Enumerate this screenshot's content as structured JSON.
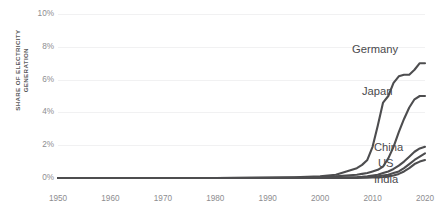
{
  "chart_data": {
    "type": "line",
    "title": "",
    "subtitle": "",
    "xlabel": "",
    "ylabel": "SHARE OF ELECTRICITY\nGENERATION",
    "xlim": [
      1950,
      2020
    ],
    "ylim": [
      0,
      10
    ],
    "grid": true,
    "legend_position": "right-inline-labels",
    "x_ticks": [
      "1950",
      "1960",
      "1970",
      "1980",
      "1990",
      "2000",
      "2010",
      "2020"
    ],
    "x_tick_values": [
      1950,
      1960,
      1970,
      1980,
      1990,
      2000,
      2010,
      2020
    ],
    "y_ticks": [
      "0%",
      "2%",
      "4%",
      "6%",
      "8%",
      "10%"
    ],
    "y_tick_values": [
      0,
      2,
      4,
      6,
      8,
      10
    ],
    "line_color": "#4d4d4f",
    "x": [
      1950,
      1960,
      1970,
      1980,
      1990,
      1995,
      2000,
      2003,
      2005,
      2007,
      2008,
      2009,
      2010,
      2011,
      2012,
      2013,
      2014,
      2015,
      2016,
      2017,
      2018,
      2019,
      2020
    ],
    "series": [
      {
        "name": "Germany",
        "label": "Germany",
        "color": "#4d4d4f",
        "values": [
          0,
          0,
          0,
          0,
          0.02,
          0.05,
          0.1,
          0.2,
          0.4,
          0.6,
          0.8,
          1.1,
          1.9,
          3.2,
          4.6,
          5.0,
          5.8,
          6.2,
          6.3,
          6.3,
          6.6,
          7.0,
          7.0
        ]
      },
      {
        "name": "Japan",
        "label": "Japan",
        "color": "#4d4d4f",
        "values": [
          0,
          0,
          0,
          0,
          0.01,
          0.02,
          0.05,
          0.1,
          0.15,
          0.2,
          0.25,
          0.3,
          0.4,
          0.5,
          0.7,
          1.2,
          1.9,
          2.8,
          3.6,
          4.3,
          4.8,
          5.0,
          5.0
        ]
      },
      {
        "name": "China",
        "label": "China",
        "color": "#4d4d4f",
        "values": [
          0,
          0,
          0,
          0,
          0,
          0,
          0.01,
          0.02,
          0.03,
          0.05,
          0.07,
          0.1,
          0.15,
          0.2,
          0.3,
          0.4,
          0.55,
          0.75,
          1.0,
          1.3,
          1.6,
          1.8,
          1.9
        ]
      },
      {
        "name": "US",
        "label": "US",
        "color": "#4d4d4f",
        "values": [
          0,
          0,
          0,
          0,
          0,
          0,
          0.01,
          0.01,
          0.02,
          0.03,
          0.04,
          0.06,
          0.08,
          0.1,
          0.15,
          0.2,
          0.3,
          0.4,
          0.6,
          0.85,
          1.1,
          1.3,
          1.5
        ]
      },
      {
        "name": "India",
        "label": "India",
        "color": "#4d4d4f",
        "values": [
          0,
          0,
          0,
          0,
          0,
          0,
          0,
          0,
          0.01,
          0.01,
          0.02,
          0.02,
          0.03,
          0.04,
          0.06,
          0.1,
          0.15,
          0.25,
          0.4,
          0.6,
          0.85,
          1.0,
          1.1
        ]
      }
    ]
  },
  "axes": {
    "y_title_line1": "SHARE OF ELECTRICITY",
    "y_title_line2": "GENERATION",
    "y_tick_0": "0%",
    "y_tick_1": "2%",
    "y_tick_2": "4%",
    "y_tick_3": "6%",
    "y_tick_4": "8%",
    "y_tick_5": "10%",
    "x_tick_0": "1950",
    "x_tick_1": "1960",
    "x_tick_2": "1970",
    "x_tick_3": "1980",
    "x_tick_4": "1990",
    "x_tick_5": "2000",
    "x_tick_6": "2010",
    "x_tick_7": "2020"
  },
  "labels": {
    "germany": "Germany",
    "japan": "Japan",
    "china": "China",
    "us": "US",
    "india": "India"
  }
}
